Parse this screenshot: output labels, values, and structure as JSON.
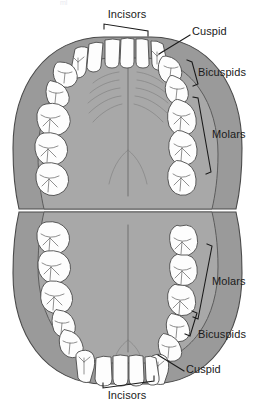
{
  "figure": {
    "background_color": "#ffffff",
    "palate_color": "#a8a8a8",
    "gingiva_color": "#9a9a9a",
    "tooth_color": "#fdfdfd",
    "outline_color": "#4a4a4a",
    "label_color": "#1a1a1a",
    "top_cropped_text": "ml"
  },
  "labels": {
    "upper_incisors": "Incisors",
    "upper_cuspid": "Cuspid",
    "upper_bicuspids": "Bicuspids",
    "upper_molars": "Molars",
    "lower_molars": "Molars",
    "lower_bicuspids": "Bicuspids",
    "lower_cuspid": "Cuspid",
    "lower_incisors": "Incisors"
  },
  "arches": {
    "upper": {
      "name": "maxillary-arch",
      "groups": [
        {
          "group": "Incisors",
          "count": 4
        },
        {
          "group": "Cuspid",
          "count": 2
        },
        {
          "group": "Bicuspids",
          "count": 4
        },
        {
          "group": "Molars",
          "count": 6
        }
      ]
    },
    "lower": {
      "name": "mandibular-arch",
      "groups": [
        {
          "group": "Incisors",
          "count": 4
        },
        {
          "group": "Cuspid",
          "count": 2
        },
        {
          "group": "Bicuspids",
          "count": 4
        },
        {
          "group": "Molars",
          "count": 6
        }
      ]
    }
  }
}
